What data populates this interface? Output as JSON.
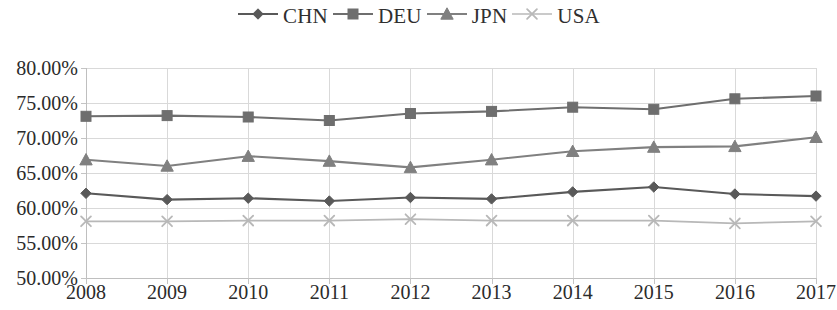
{
  "chart_data": {
    "type": "line",
    "title": "",
    "subtitle": "",
    "xlabel": "",
    "ylabel": "",
    "categories": [
      "2008",
      "2009",
      "2010",
      "2011",
      "2012",
      "2013",
      "2014",
      "2015",
      "2016",
      "2017"
    ],
    "x": [
      2008,
      2009,
      2010,
      2011,
      2012,
      2013,
      2014,
      2015,
      2016,
      2017
    ],
    "ylim": [
      50.0,
      80.0
    ],
    "ytick_step": 5.0,
    "ytick_labels": [
      "80.00%",
      "75.00%",
      "70.00%",
      "65.00%",
      "60.00%",
      "55.00%",
      "50.00%"
    ],
    "ytick_values": [
      80.0,
      75.0,
      70.0,
      65.0,
      60.0,
      55.0,
      50.0
    ],
    "value_suffix": "%",
    "grid": "vertical-and-horizontal-light",
    "legend_position": "top-center",
    "series": [
      {
        "name": "CHN",
        "marker": "diamond",
        "color": "#595959",
        "values": [
          62.1,
          61.2,
          61.4,
          61.0,
          61.5,
          61.3,
          62.3,
          63.0,
          62.0,
          61.7
        ]
      },
      {
        "name": "DEU",
        "marker": "square",
        "color": "#6e6e6e",
        "values": [
          73.1,
          73.2,
          73.0,
          72.5,
          73.5,
          73.8,
          74.4,
          74.1,
          75.6,
          76.0
        ]
      },
      {
        "name": "JPN",
        "marker": "triangle",
        "color": "#808080",
        "values": [
          66.9,
          66.0,
          67.4,
          66.7,
          65.8,
          66.9,
          68.1,
          68.7,
          68.8,
          70.1
        ]
      },
      {
        "name": "USA",
        "marker": "cross",
        "color": "#b8b8b8",
        "values": [
          58.1,
          58.1,
          58.2,
          58.2,
          58.4,
          58.2,
          58.2,
          58.2,
          57.8,
          58.1
        ]
      }
    ]
  },
  "legend": {
    "items": [
      {
        "label": "CHN",
        "marker": "diamond",
        "color": "#595959"
      },
      {
        "label": "DEU",
        "marker": "square",
        "color": "#6e6e6e"
      },
      {
        "label": "JPN",
        "marker": "triangle",
        "color": "#808080"
      },
      {
        "label": "USA",
        "marker": "cross",
        "color": "#b8b8b8"
      }
    ]
  },
  "axes": {
    "grid_color": "#d9d9d9",
    "axis_color": "#bfbfbf",
    "tick_color": "#c4c4c4",
    "text_color": "#2b2b2b"
  }
}
